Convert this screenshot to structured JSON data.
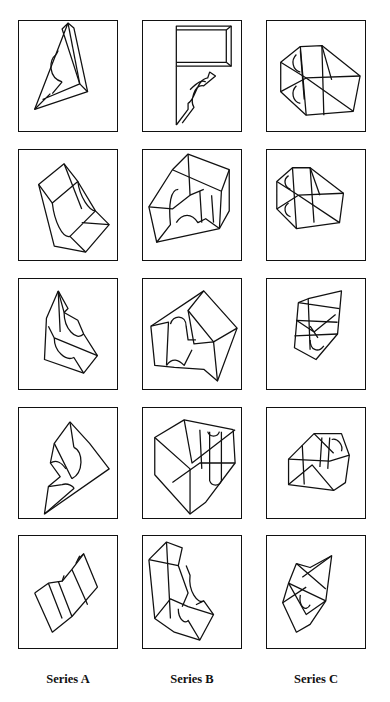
{
  "figure": {
    "columns": [
      {
        "label": "Series A"
      },
      {
        "label": "Series B"
      },
      {
        "label": "Series C"
      }
    ],
    "rows": 5,
    "cells": [
      {
        "row": 1,
        "series": "A",
        "description": "wedge-shaped block with semicircular notch"
      },
      {
        "row": 1,
        "series": "B",
        "description": "rectangular slab with curved profile below"
      },
      {
        "row": 1,
        "series": "C",
        "description": "wireframe block with two half-circle notches"
      },
      {
        "row": 2,
        "series": "A",
        "description": "block with concave cylindrical cut"
      },
      {
        "row": 2,
        "series": "B",
        "description": "box block with arched opening"
      },
      {
        "row": 2,
        "series": "C",
        "description": "wireframe block with two half-circle notches"
      },
      {
        "row": 3,
        "series": "A",
        "description": "block with concave cylindrical cut, rotated"
      },
      {
        "row": 3,
        "series": "B",
        "description": "box block with arched opening, rotated"
      },
      {
        "row": 3,
        "series": "C",
        "description": "wireframe block with circle notch, rotated"
      },
      {
        "row": 4,
        "series": "A",
        "description": "wedge-shaped block with semicircular notch, rotated"
      },
      {
        "row": 4,
        "series": "B",
        "description": "V-shaped block with half-cylinder cut"
      },
      {
        "row": 4,
        "series": "C",
        "description": "compact wireframe block with notch"
      },
      {
        "row": 5,
        "series": "A",
        "description": "slanted slab with shallow groove"
      },
      {
        "row": 5,
        "series": "B",
        "description": "L-shaped block with concave cut"
      },
      {
        "row": 5,
        "series": "C",
        "description": "wireframe block with half-circle notch, tilted"
      }
    ]
  }
}
